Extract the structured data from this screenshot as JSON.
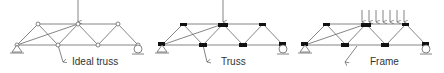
{
  "panels": [
    {
      "id": "ideal-truss",
      "label": "Ideal truss",
      "joints": "pinned (open circles)",
      "load": "single point load"
    },
    {
      "id": "truss",
      "label": "Truss",
      "joints": "rigid (filled gusset plates)",
      "load": "single point load"
    },
    {
      "id": "frame",
      "label": "Frame",
      "joints": "rigid (filled gusset plates)",
      "load": "distributed load"
    }
  ],
  "colors": {
    "line": "#555555",
    "fill": "#111111"
  }
}
